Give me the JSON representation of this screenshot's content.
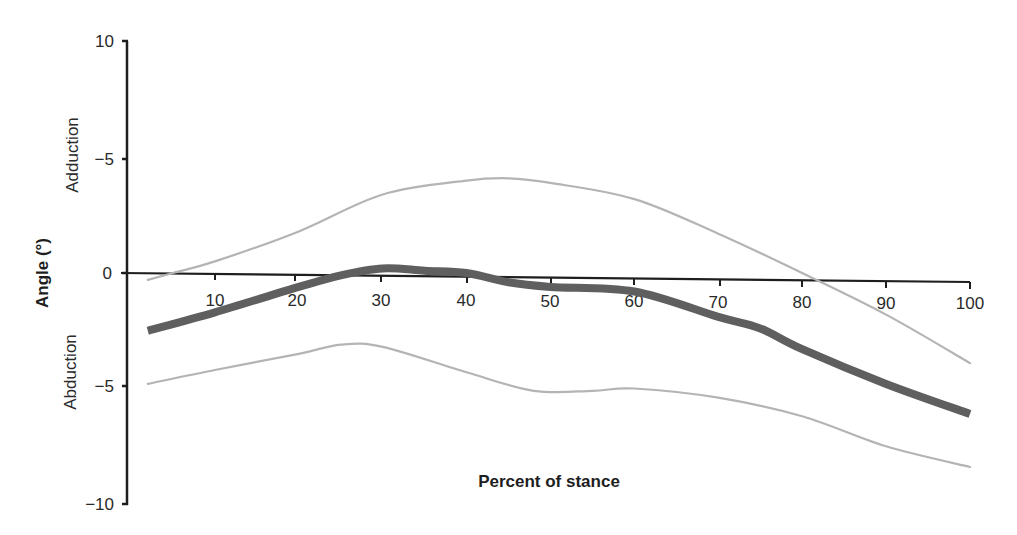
{
  "chart_data": {
    "type": "line",
    "title": "",
    "xlabel": "Percent of stance",
    "ylabel": "Angle (°)",
    "xlim": [
      0,
      100
    ],
    "ylim": [
      -10,
      10
    ],
    "grid": false,
    "legend": null,
    "x_ticks": [
      "10",
      "20",
      "30",
      "40",
      "50",
      "60",
      "70",
      "80",
      "90",
      "100"
    ],
    "y_ticks": [
      {
        "label": "10",
        "value": 10
      },
      {
        "label": "−5",
        "value": 5
      },
      {
        "label": "0",
        "value": 0
      },
      {
        "label": "−5",
        "value": -5
      },
      {
        "label": "−10",
        "value": -10
      }
    ],
    "annotations": [
      {
        "text": "Adduction",
        "region": "above zero"
      },
      {
        "text": "Abduction",
        "region": "below zero"
      }
    ],
    "series": [
      {
        "name": "Upper bound (mean + SD)",
        "style": "thin light gray",
        "color": "#b4b4b4",
        "x": [
          2,
          5,
          10,
          20,
          30,
          40,
          45,
          50,
          60,
          70,
          80,
          90,
          100
        ],
        "values": [
          -0.3,
          0.0,
          0.5,
          1.8,
          3.4,
          4.0,
          4.1,
          3.9,
          3.2,
          1.7,
          0.0,
          -1.8,
          -3.9
        ]
      },
      {
        "name": "Mean",
        "style": "thick dark gray",
        "color": "#5f5f5f",
        "x": [
          2,
          10,
          20,
          25,
          30,
          35,
          40,
          45,
          50,
          60,
          70,
          75,
          80,
          90,
          100
        ],
        "values": [
          -2.5,
          -1.7,
          -0.6,
          -0.1,
          0.2,
          0.1,
          0.0,
          -0.4,
          -0.6,
          -0.8,
          -1.9,
          -2.4,
          -3.3,
          -4.8,
          -6.1
        ]
      },
      {
        "name": "Lower bound (mean − SD)",
        "style": "thin light gray",
        "color": "#b4b4b4",
        "x": [
          2,
          10,
          20,
          25,
          30,
          40,
          48,
          55,
          60,
          70,
          80,
          90,
          100
        ],
        "values": [
          -4.8,
          -4.2,
          -3.5,
          -3.1,
          -3.2,
          -4.3,
          -5.1,
          -5.1,
          -5.0,
          -5.4,
          -6.2,
          -7.5,
          -8.4
        ]
      }
    ],
    "colors": {
      "axis": "#1e1e1e",
      "band": "#b4b4b4",
      "mean": "#5f5f5f"
    }
  },
  "layout_px": {
    "x_origin": 131,
    "x_scale": 8.39,
    "y_zero": 273,
    "y_scale": 23.1
  }
}
